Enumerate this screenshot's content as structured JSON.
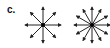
{
  "panel": {
    "label": "c."
  },
  "figures": [
    {
      "name": "field-diagram-8",
      "center": [
        43,
        25
      ],
      "length": 18,
      "arrows": 8,
      "color": "#222222"
    },
    {
      "name": "field-diagram-12",
      "center": [
        92,
        25
      ],
      "length": 18,
      "arrows": 12,
      "color": "#222222"
    }
  ]
}
